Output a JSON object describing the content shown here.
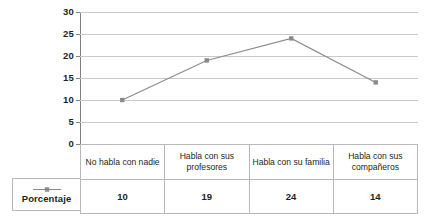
{
  "chart_data": {
    "type": "line",
    "title": "",
    "xlabel": "",
    "ylabel": "",
    "ylim": [
      0,
      30
    ],
    "ytick_step": 5,
    "yticks": [
      30,
      25,
      20,
      15,
      10,
      5,
      0
    ],
    "grid": true,
    "legend_position": "left-bottom",
    "categories": [
      "No habla con nadie",
      "Habla con sus profesores",
      "Habla con su familia",
      "Habla con sus compañeros"
    ],
    "series": [
      {
        "name": "Porcentaje",
        "values": [
          10,
          19,
          24,
          14
        ],
        "color": "#8a8a8a",
        "marker": "square"
      }
    ]
  },
  "table": {
    "row_header": "Porcentaje",
    "category_row": [
      "No habla con nadie",
      "Habla con sus profesores",
      "Habla con su familia",
      "Habla con sus compañeros"
    ],
    "value_row": [
      "10",
      "19",
      "24",
      "14"
    ]
  },
  "legend": {
    "label": "Porcentaje",
    "marker_name": "line-square-marker"
  },
  "colors": {
    "series": "#8a8a8a",
    "gridline": "#c9c9c9",
    "axis": "#808080",
    "table_border": "#b8b8b8",
    "text": "#231f20",
    "background": "#ffffff"
  }
}
